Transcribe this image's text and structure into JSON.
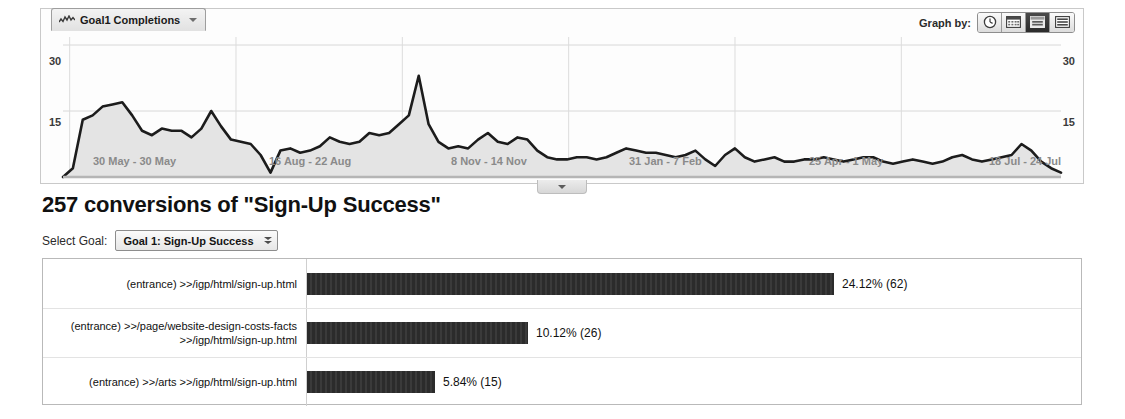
{
  "metric_tab": {
    "label": "Goal1 Completions",
    "icon": "sparkline-icon",
    "caret": "chevron-down-icon"
  },
  "graph_by": {
    "label": "Graph by:",
    "options": [
      {
        "name": "hour",
        "icon": "clock-icon",
        "selected": false
      },
      {
        "name": "day",
        "icon": "day-grid-icon",
        "selected": false
      },
      {
        "name": "week",
        "icon": "week-calendar-icon",
        "selected": true
      },
      {
        "name": "month",
        "icon": "month-lines-icon",
        "selected": false
      }
    ]
  },
  "heading": "257 conversions of \"Sign-Up Success\"",
  "goal_picker": {
    "label": "Select Goal:",
    "value": "Goal 1: Sign-Up Success",
    "caret": "double-chevron-icon"
  },
  "timeline_handle_icon": "collapse-chevron-icon",
  "chart_data": [
    {
      "type": "area",
      "title": "Goal1 Completions",
      "ylabel": "",
      "xlabel": "",
      "ylim": [
        0,
        30
      ],
      "yticks": [
        15,
        30
      ],
      "ytick_labels_left": [
        "15",
        "30"
      ],
      "ytick_labels_right": [
        "15",
        "30"
      ],
      "grid": true,
      "legend": "none",
      "xtick_labels": [
        "30 May - 30 May",
        "16 Aug - 22 Aug",
        "8 Nov - 14 Nov",
        "31 Jan - 7 Feb",
        "25 Apr - 1 May",
        "18 Jul - 24 Jul"
      ],
      "values": [
        0,
        2,
        13,
        14,
        16,
        16.5,
        17,
        14,
        10.5,
        9.5,
        11,
        10.5,
        10.5,
        9,
        11,
        15,
        11.5,
        8.5,
        8,
        7.5,
        5,
        1,
        6,
        6.5,
        5.5,
        6,
        7,
        9,
        8,
        7.5,
        8,
        10,
        9.5,
        10,
        12,
        14,
        23,
        12,
        8,
        6.5,
        7,
        6.5,
        8.5,
        10,
        8,
        7.5,
        9,
        8.5,
        6,
        4.5,
        4,
        4,
        4.5,
        4.5,
        4,
        4.5,
        5.5,
        6.5,
        6,
        5.5,
        5.5,
        5,
        4.5,
        5,
        6,
        4,
        2.5,
        5,
        6.5,
        4.5,
        3.5,
        4,
        4.5,
        3.5,
        3.5,
        4,
        4,
        4.5,
        4,
        3.5,
        4,
        4.5,
        4.5,
        3.5,
        3,
        3.5,
        4,
        3.5,
        3,
        3.5,
        4.5,
        5,
        4,
        3.5,
        4,
        4.5,
        5,
        7.5,
        6,
        3.5,
        2,
        1
      ]
    },
    {
      "type": "bar",
      "orientation": "horizontal",
      "title": "257 conversions of \"Sign-Up Success\"",
      "categories": [
        "(entrance) >>/igp/html/sign-up.html",
        "(entrance) >>/page/website-design-costs-facts >>/igp/html/sign-up.html",
        "(entrance) >>/arts >>/igp/html/sign-up.html"
      ],
      "values": [
        24.12,
        10.12,
        5.84
      ],
      "counts": [
        62,
        26,
        15
      ],
      "value_labels": [
        "24.12% (62)",
        "10.12% (26)",
        "5.84% (15)"
      ],
      "xlim": [
        0,
        26
      ],
      "grid": false,
      "legend": "none"
    }
  ]
}
